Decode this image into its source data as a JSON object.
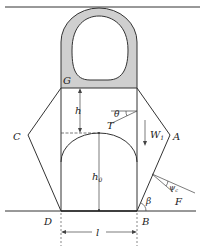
{
  "figure": {
    "labels": {
      "G": "G",
      "C": "C",
      "A": "A",
      "D": "D",
      "B": "B",
      "h": "h",
      "h0_main": "h",
      "h0_sub": "0",
      "theta": "θ",
      "T": "T",
      "W1_main": "W",
      "W1_sub": "1",
      "beta": "β",
      "psi_main": "ψ",
      "psi_sub": "c",
      "F": "F",
      "l": "l"
    },
    "colors": {
      "fill_gray": "#cfcfcf",
      "line": "#333333"
    }
  }
}
